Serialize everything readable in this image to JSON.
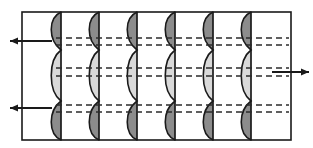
{
  "figure": {
    "type": "technical-diagram",
    "canvas": {
      "width": 313,
      "height": 148,
      "background": "#ffffff"
    },
    "frame": {
      "x": 22,
      "y": 12,
      "width": 269,
      "height": 128,
      "stroke": "#1a1a1a",
      "stroke_width": 1.6,
      "fill": "#ffffff"
    },
    "station_lines": {
      "count": 6,
      "x_positions": [
        61,
        99,
        137,
        175,
        213,
        251
      ],
      "stroke": "#1a1a1a",
      "stroke_width": 1.7,
      "y_top": 12,
      "y_bottom": 140
    },
    "profile_curve": {
      "shape": "s-curve",
      "side": "left",
      "amplitude": 13,
      "stroke": "#1a1a1a",
      "stroke_width": 1.6,
      "lobe_fill_dark": "#8c8c8c",
      "lobe_fill_light": "#d9d9d9",
      "nodes_y": [
        12,
        50,
        101,
        140
      ],
      "peak_top_y": 31,
      "peak_mid_y": 76,
      "peak_bottom_y": 121
    },
    "dashed_lines": {
      "stroke": "#2b2b2b",
      "stroke_width": 1.5,
      "dash_pattern": "6 4",
      "x_start": 56,
      "x_end": 289,
      "y_positions": [
        38,
        45,
        68,
        76,
        105,
        112
      ]
    },
    "arrows": [
      {
        "id": "arrow-top-left",
        "direction": "left",
        "y": 41,
        "x_tail": 52,
        "x_head": 10,
        "label": ""
      },
      {
        "id": "arrow-middle-right",
        "direction": "right",
        "y": 72,
        "x_tail": 272,
        "x_head": 309,
        "label": ""
      },
      {
        "id": "arrow-bottom-left",
        "direction": "left",
        "y": 108,
        "x_tail": 52,
        "x_head": 10,
        "label": ""
      }
    ],
    "arrow_style": {
      "stroke": "#1a1a1a",
      "stroke_width": 2.0,
      "head_length": 8,
      "head_width": 7
    },
    "labels": [],
    "annotations": []
  }
}
